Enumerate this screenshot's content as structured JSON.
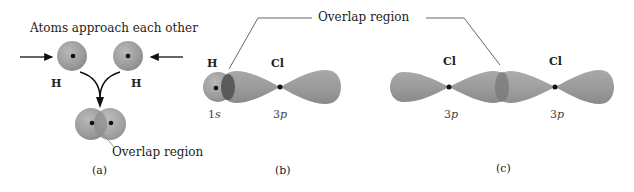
{
  "figure": {
    "panel_a": {
      "heading": "Atoms approach each other",
      "atom_labels": [
        "H",
        "H"
      ],
      "overlap_label": "Overlap region",
      "panel_label": "(a)"
    },
    "panel_b": {
      "atom_labels": [
        "H",
        "Cl"
      ],
      "orbital_labels": [
        {
          "num": "1",
          "letter": "s"
        },
        {
          "num": "3",
          "letter": "p"
        }
      ],
      "panel_label": "(b)"
    },
    "panel_c": {
      "atom_labels": [
        "Cl",
        "Cl"
      ],
      "orbital_labels": [
        {
          "num": "3",
          "letter": "p"
        },
        {
          "num": "3",
          "letter": "p"
        }
      ],
      "panel_label": "(c)"
    },
    "shared_overlap_label": "Overlap region",
    "colors": {
      "orbital_fill": "#9a9a9a",
      "orbital_light": "#b8b8b8",
      "overlap_dark": "#5e5e5e",
      "nucleus": "#111111",
      "leader_line": "#555555",
      "arrow": "#111111"
    }
  }
}
